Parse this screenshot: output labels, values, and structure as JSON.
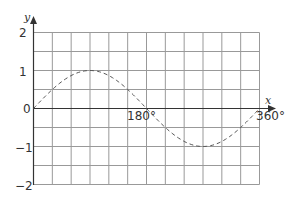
{
  "chart_data": {
    "type": "line",
    "title": "",
    "xlabel": "x",
    "ylabel": "y",
    "series": [
      {
        "name": "y = sin x",
        "style": "dashed",
        "x": [
          0,
          30,
          60,
          90,
          120,
          150,
          180,
          210,
          240,
          270,
          300,
          330,
          360
        ],
        "values": [
          0,
          0.5,
          0.866,
          1,
          0.866,
          0.5,
          0,
          -0.5,
          -0.866,
          -1,
          -0.866,
          -0.5,
          0
        ]
      }
    ],
    "xlim": [
      0,
      360
    ],
    "ylim": [
      -2,
      2
    ],
    "x_tick_labels": [
      "180°",
      "360°"
    ],
    "y_tick_labels": [
      "2",
      "1",
      "0",
      "−1",
      "−2"
    ],
    "grid": true,
    "grid_columns": 12,
    "grid_rows": 8
  },
  "labels": {
    "x_axis": "x",
    "y_axis": "y",
    "x180": "180°",
    "x360": "360°",
    "y2": "2",
    "y1": "1",
    "y0": "0",
    "ym1": "−1",
    "ym2": "−2"
  }
}
